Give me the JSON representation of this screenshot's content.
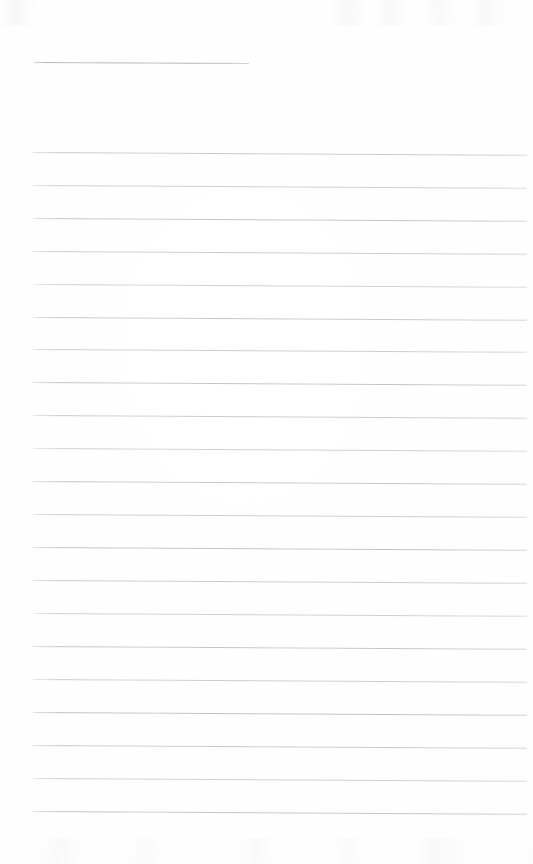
{
  "page": {
    "kind": "scanned-lined-notebook-page",
    "width": 533,
    "height": 864,
    "background_color": "#fdfdfd",
    "rule_color": "#b9bcc2",
    "header_rule_color": "#a9acb3",
    "text_content": "",
    "handwriting_present": "none",
    "notes_label": ""
  },
  "header_rule": {
    "name": "title-rule",
    "x": 33,
    "y": 62,
    "width": 216,
    "skew_deg": 0.26
  },
  "body": {
    "line_count": 21,
    "first_line_y": 152,
    "line_spacing": 32.95,
    "left_x": 33,
    "right_x": 527,
    "skew_deg": 0.33,
    "lines": [
      {
        "index": 1,
        "y": 152,
        "left": 33,
        "right": 527,
        "content": ""
      },
      {
        "index": 2,
        "y": 185,
        "left": 33,
        "right": 527,
        "content": ""
      },
      {
        "index": 3,
        "y": 218,
        "left": 33,
        "right": 527,
        "content": ""
      },
      {
        "index": 4,
        "y": 251,
        "left": 33,
        "right": 527,
        "content": ""
      },
      {
        "index": 5,
        "y": 284,
        "left": 33,
        "right": 527,
        "content": ""
      },
      {
        "index": 6,
        "y": 317,
        "left": 33,
        "right": 527,
        "content": ""
      },
      {
        "index": 7,
        "y": 349,
        "left": 33,
        "right": 527,
        "content": ""
      },
      {
        "index": 8,
        "y": 382,
        "left": 33,
        "right": 527,
        "content": ""
      },
      {
        "index": 9,
        "y": 415,
        "left": 33,
        "right": 527,
        "content": ""
      },
      {
        "index": 10,
        "y": 448,
        "left": 33,
        "right": 527,
        "content": ""
      },
      {
        "index": 11,
        "y": 481,
        "left": 33,
        "right": 527,
        "content": ""
      },
      {
        "index": 12,
        "y": 514,
        "left": 33,
        "right": 527,
        "content": ""
      },
      {
        "index": 13,
        "y": 547,
        "left": 33,
        "right": 527,
        "content": ""
      },
      {
        "index": 14,
        "y": 580,
        "left": 33,
        "right": 527,
        "content": ""
      },
      {
        "index": 15,
        "y": 613,
        "left": 33,
        "right": 527,
        "content": ""
      },
      {
        "index": 16,
        "y": 646,
        "left": 33,
        "right": 527,
        "content": ""
      },
      {
        "index": 17,
        "y": 679,
        "left": 33,
        "right": 527,
        "content": ""
      },
      {
        "index": 18,
        "y": 712,
        "left": 33,
        "right": 527,
        "content": ""
      },
      {
        "index": 19,
        "y": 745,
        "left": 33,
        "right": 527,
        "content": ""
      },
      {
        "index": 20,
        "y": 778,
        "left": 33,
        "right": 527,
        "content": ""
      },
      {
        "index": 21,
        "y": 811,
        "left": 33,
        "right": 527,
        "content": ""
      }
    ]
  },
  "footer_area": {
    "name": "blank-bottom-margin",
    "top_y": 812,
    "height": 52,
    "content": ""
  }
}
